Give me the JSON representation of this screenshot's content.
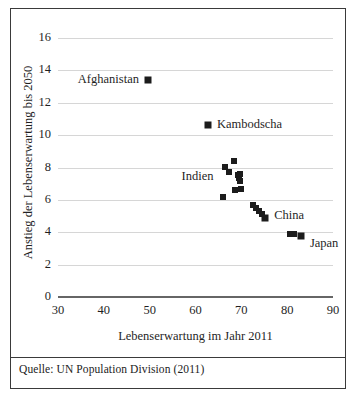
{
  "figure": {
    "source_note": "Quelle: UN Population Division (2011)"
  },
  "chart_data": {
    "type": "scatter",
    "title": "",
    "xlabel": "Lebenserwartung im Jahr 2011",
    "ylabel": "Anstieg der Lebenserwartung bis 2050",
    "xlim": [
      30,
      90
    ],
    "ylim": [
      0,
      16
    ],
    "xticks": [
      30,
      40,
      50,
      60,
      70,
      80,
      90
    ],
    "yticks": [
      0,
      2,
      4,
      6,
      8,
      10,
      12,
      14,
      16
    ],
    "grid": "horizontal",
    "legend": "none",
    "marker_color": "#1c1c1c",
    "marker_shape": "square",
    "gridline_color": "#d6d6d6",
    "axis_color": "#666666",
    "points": [
      {
        "x": 49.6,
        "y": 13.4,
        "label": "Afghanistan"
      },
      {
        "x": 62.7,
        "y": 10.6,
        "label": "Kambodscha"
      },
      {
        "x": 65.9,
        "y": 6.2,
        "label": ""
      },
      {
        "x": 66.5,
        "y": 8.05,
        "label": ""
      },
      {
        "x": 67.2,
        "y": 7.7,
        "label": ""
      },
      {
        "x": 68.4,
        "y": 8.4,
        "label": ""
      },
      {
        "x": 68.6,
        "y": 6.6,
        "label": ""
      },
      {
        "x": 69.2,
        "y": 7.55,
        "label": ""
      },
      {
        "x": 69.4,
        "y": 7.35,
        "label": ""
      },
      {
        "x": 69.6,
        "y": 7.15,
        "label": ""
      },
      {
        "x": 69.8,
        "y": 7.6,
        "label": ""
      },
      {
        "x": 69.9,
        "y": 6.65,
        "label": ""
      },
      {
        "x": 72.6,
        "y": 5.7,
        "label": ""
      },
      {
        "x": 73.2,
        "y": 5.5,
        "label": ""
      },
      {
        "x": 73.8,
        "y": 5.3,
        "label": ""
      },
      {
        "x": 74.4,
        "y": 5.1,
        "label": ""
      },
      {
        "x": 75.2,
        "y": 4.9,
        "label": "China"
      },
      {
        "x": 80.6,
        "y": 3.9,
        "label": ""
      },
      {
        "x": 81.4,
        "y": 3.9,
        "label": ""
      },
      {
        "x": 83.0,
        "y": 3.75,
        "label": "Japan"
      }
    ],
    "annotations": [
      {
        "text": "Afghanistan",
        "anchor_x": 49.6,
        "anchor_y": 13.4,
        "placement": "left"
      },
      {
        "text": "Kambodscha",
        "anchor_x": 62.7,
        "anchor_y": 10.6,
        "placement": "right"
      },
      {
        "text": "Indien",
        "anchor_x": 65.9,
        "anchor_y": 7.4,
        "placement": "left"
      },
      {
        "text": "China",
        "anchor_x": 75.2,
        "anchor_y": 5.0,
        "placement": "right"
      },
      {
        "text": "Japan",
        "anchor_x": 83.0,
        "anchor_y": 3.3,
        "placement": "right"
      }
    ]
  }
}
